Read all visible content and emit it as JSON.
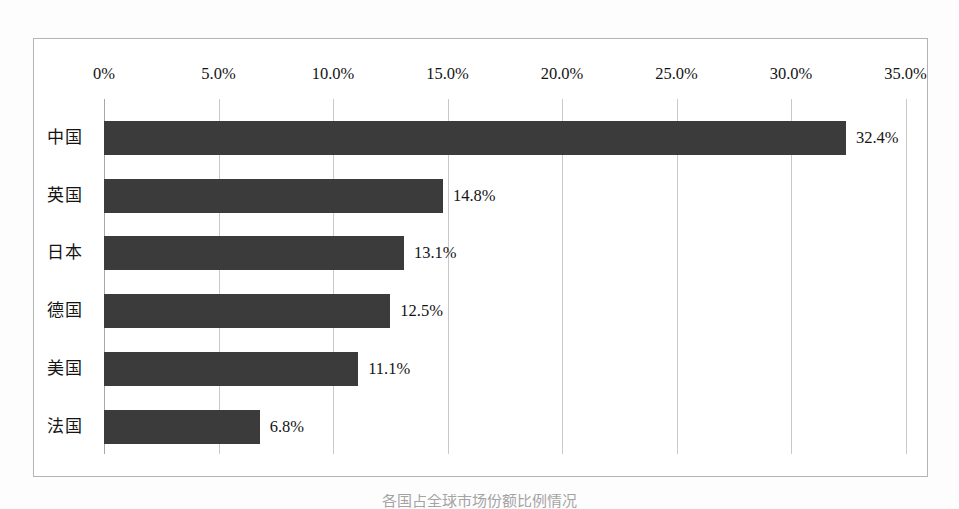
{
  "figure": {
    "caption": "各国占全球市场份额比例情况",
    "background_color": "#fdfdfd",
    "frame_border_color": "#b4b4b4"
  },
  "chart_data": {
    "type": "bar",
    "orientation": "horizontal",
    "title": "",
    "xlabel": "",
    "ylabel": "",
    "categories": [
      "中国",
      "英国",
      "日本",
      "德国",
      "美国",
      "法国"
    ],
    "values": [
      32.4,
      14.8,
      13.1,
      12.5,
      11.1,
      6.8
    ],
    "value_labels": [
      "32.4%",
      "14.8%",
      "13.1%",
      "12.5%",
      "11.1%",
      "6.8%"
    ],
    "xlim": [
      0,
      35
    ],
    "xticks": [
      0,
      5,
      10,
      15,
      20,
      25,
      30,
      35
    ],
    "xtick_labels": [
      "0%",
      "5.0%",
      "10.0%",
      "15.0%",
      "20.0%",
      "25.0%",
      "30.0%",
      "35.0%"
    ],
    "grid": "vertical",
    "axis_position": "top",
    "legend": "none",
    "series": [
      {
        "name": "占比",
        "color": "#3b3b3b",
        "values": [
          32.4,
          14.8,
          13.1,
          12.5,
          11.1,
          6.8
        ]
      }
    ]
  }
}
